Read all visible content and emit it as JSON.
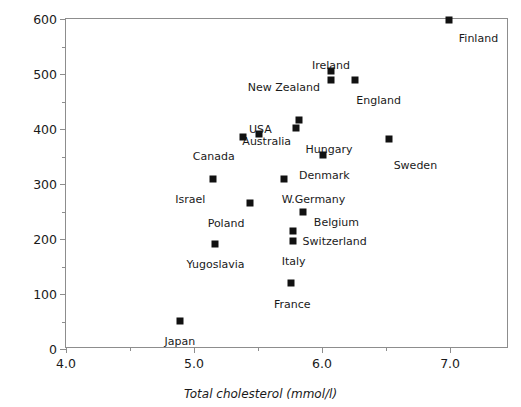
{
  "chart_data": {
    "type": "scatter",
    "title": "",
    "xlabel": "Total cholesterol (mmol/l)",
    "ylabel": "CHD deaths (per 100 000)",
    "xlim": [
      4.0,
      7.46
    ],
    "ylim": [
      0,
      600
    ],
    "grid": false,
    "legend": "none",
    "xticks_major": [
      {
        "value": 4.0,
        "label": "4.0"
      },
      {
        "value": 5.0,
        "label": "5.0"
      },
      {
        "value": 6.0,
        "label": "6.0"
      },
      {
        "value": 7.0,
        "label": "7.0"
      }
    ],
    "xticks_minor": [
      4.5,
      5.5,
      6.5
    ],
    "yticks_major": [
      {
        "value": 0,
        "label": "0"
      },
      {
        "value": 100,
        "label": "100"
      },
      {
        "value": 200,
        "label": "200"
      },
      {
        "value": 300,
        "label": "300"
      },
      {
        "value": 400,
        "label": "400"
      },
      {
        "value": 500,
        "label": "500"
      },
      {
        "value": 600,
        "label": "600"
      }
    ],
    "yticks_minor": [
      50,
      150,
      250,
      350,
      450,
      550
    ],
    "marker_color": "#111111",
    "axis_color": "#8d8d8d",
    "points": [
      {
        "label": "Finland",
        "x": 6.99,
        "y": 598,
        "label_dx": 10,
        "label_dy": 13,
        "anchor": "left"
      },
      {
        "label": "Ireland",
        "x": 6.07,
        "y": 505,
        "label_dx": 0,
        "label_dy": -11,
        "anchor": "center"
      },
      {
        "label": "New Zealand",
        "x": 6.07,
        "y": 489,
        "label_dx": -9,
        "label_dy": 2,
        "anchor": "right"
      },
      {
        "label": "England",
        "x": 6.26,
        "y": 489,
        "label_dx": 1,
        "label_dy": 15,
        "anchor": "left"
      },
      {
        "label": "Australia",
        "x": 5.82,
        "y": 416,
        "label_dx": -6,
        "label_dy": 16,
        "anchor": "right"
      },
      {
        "label": "Hungary",
        "x": 5.8,
        "y": 402,
        "label_dx": 9,
        "label_dy": 16,
        "anchor": "left"
      },
      {
        "label": "USA",
        "x": 5.51,
        "y": 391,
        "label_dx": 1,
        "label_dy": -10,
        "anchor": "center"
      },
      {
        "label": "Canada",
        "x": 5.38,
        "y": 385,
        "label_dx": -6,
        "label_dy": 14,
        "anchor": "right"
      },
      {
        "label": "Sweden",
        "x": 6.52,
        "y": 382,
        "label_dx": 5,
        "label_dy": 21,
        "anchor": "left"
      },
      {
        "label": "Denmark",
        "x": 6.01,
        "y": 353,
        "label_dx": 1,
        "label_dy": 15,
        "anchor": "center"
      },
      {
        "label": "Israel",
        "x": 5.15,
        "y": 309,
        "label_dx": -6,
        "label_dy": 15,
        "anchor": "right"
      },
      {
        "label": "W.Germany",
        "x": 5.7,
        "y": 309,
        "label_dx": -2,
        "label_dy": 15,
        "anchor": "left"
      },
      {
        "label": "Poland",
        "x": 5.44,
        "y": 265,
        "label_dx": -4,
        "label_dy": 15,
        "anchor": "right"
      },
      {
        "label": "Belgium",
        "x": 5.85,
        "y": 249,
        "label_dx": 11,
        "label_dy": 5,
        "anchor": "left"
      },
      {
        "label": "Switzerland",
        "x": 5.77,
        "y": 214,
        "label_dx": 10,
        "label_dy": 5,
        "anchor": "left"
      },
      {
        "label": "Italy",
        "x": 5.77,
        "y": 196,
        "label_dx": 1,
        "label_dy": 15,
        "anchor": "center"
      },
      {
        "label": "Yugoslavia",
        "x": 5.16,
        "y": 191,
        "label_dx": 1,
        "label_dy": 15,
        "anchor": "center"
      },
      {
        "label": "France",
        "x": 5.76,
        "y": 120,
        "label_dx": 1,
        "label_dy": 16,
        "anchor": "center"
      },
      {
        "label": "Japan",
        "x": 4.89,
        "y": 51,
        "label_dx": 0,
        "label_dy": 15,
        "anchor": "center"
      }
    ]
  }
}
